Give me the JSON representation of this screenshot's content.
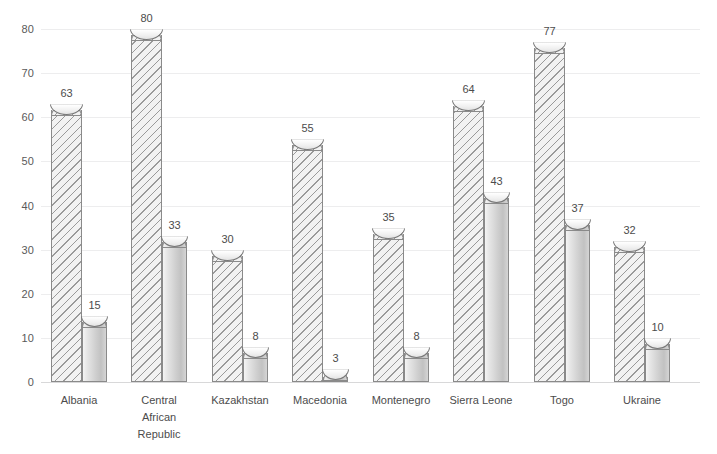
{
  "chart_data": {
    "type": "bar",
    "title": "",
    "subtitle": "",
    "xlabel": "",
    "ylabel": "",
    "ylim": [
      0,
      80
    ],
    "ytick_step": 10,
    "yticks": [
      "0",
      "10",
      "20",
      "30",
      "40",
      "50",
      "60",
      "70",
      "80"
    ],
    "grid": true,
    "legend": "none",
    "categories": [
      "Albania",
      "Central\nAfrican\nRepublic",
      "Kazakhstan",
      "Macedonia",
      "Montenegro",
      "Sierra Leone",
      "Togo",
      "Ukraine"
    ],
    "series": [
      {
        "name": "series-a",
        "style": "hatched",
        "values": [
          63,
          80,
          30,
          55,
          35,
          64,
          77,
          32
        ]
      },
      {
        "name": "series-b",
        "style": "solid",
        "values": [
          15,
          33,
          8,
          3,
          8,
          43,
          37,
          10
        ]
      }
    ]
  },
  "colors": {
    "gridline": "#ededee",
    "baseline": "#d8d8d9",
    "bar_outline": "#8a8a8a",
    "hatch": "#9a9a9a",
    "text": "#4c4c4c",
    "tick_text": "#5a5a5a",
    "background": "#ffffff"
  }
}
